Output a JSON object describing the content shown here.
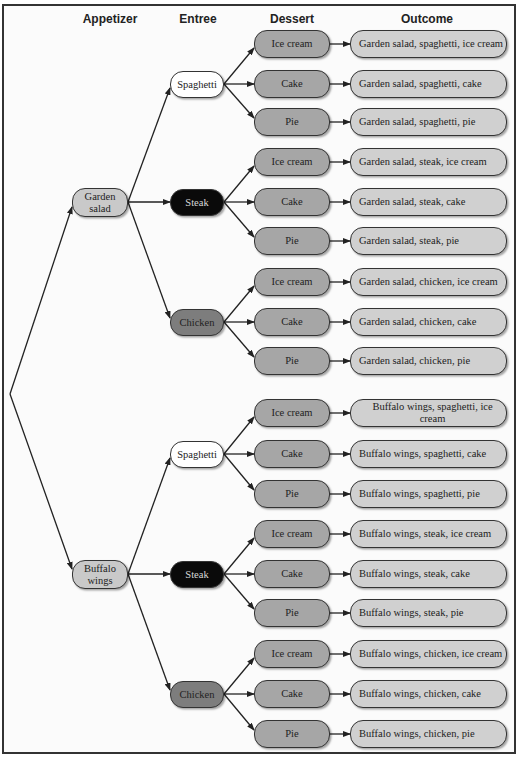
{
  "headers": {
    "appetizer": "Appetizer",
    "entree": "Entree",
    "dessert": "Dessert",
    "outcome": "Outcome"
  },
  "colors": {
    "appetizer": "#c9c9c9",
    "spaghetti": "#ffffff",
    "steak": "#0a0a0a",
    "chicken": "#7d7d7d",
    "dessert": "#a6a6a6",
    "outcome": "#d0d0d0",
    "line": "#222222"
  },
  "appetizers": [
    {
      "label": "Garden salad",
      "line1": "Garden",
      "line2": "salad"
    },
    {
      "label": "Buffalo wings",
      "line1": "Buffalo",
      "line2": "wings"
    }
  ],
  "entrees": [
    {
      "label": "Spaghetti"
    },
    {
      "label": "Steak"
    },
    {
      "label": "Chicken"
    },
    {
      "label": "Spaghetti"
    },
    {
      "label": "Steak"
    },
    {
      "label": "Chicken"
    }
  ],
  "desserts": [
    {
      "label": "Ice cream"
    },
    {
      "label": "Cake"
    },
    {
      "label": "Pie"
    },
    {
      "label": "Ice cream"
    },
    {
      "label": "Cake"
    },
    {
      "label": "Pie"
    },
    {
      "label": "Ice cream"
    },
    {
      "label": "Cake"
    },
    {
      "label": "Pie"
    },
    {
      "label": "Ice cream"
    },
    {
      "label": "Cake"
    },
    {
      "label": "Pie"
    },
    {
      "label": "Ice cream"
    },
    {
      "label": "Cake"
    },
    {
      "label": "Pie"
    },
    {
      "label": "Ice cream"
    },
    {
      "label": "Cake"
    },
    {
      "label": "Pie"
    }
  ],
  "outcomes": [
    {
      "label": "Garden salad, spaghetti, ice cream"
    },
    {
      "label": "Garden salad, spaghetti, cake"
    },
    {
      "label": "Garden salad, spaghetti, pie"
    },
    {
      "label": "Garden salad, steak, ice cream"
    },
    {
      "label": "Garden salad, steak, cake"
    },
    {
      "label": "Garden salad, steak, pie"
    },
    {
      "label": "Garden salad, chicken, ice cream"
    },
    {
      "label": "Garden salad, chicken, cake"
    },
    {
      "label": "Garden salad, chicken, pie"
    },
    {
      "label": "Buffalo wings, spaghetti, ice cream"
    },
    {
      "label": "Buffalo wings, spaghetti, cake"
    },
    {
      "label": "Buffalo wings, spaghetti, pie"
    },
    {
      "label": "Buffalo wings, steak, ice cream"
    },
    {
      "label": "Buffalo wings, steak, cake"
    },
    {
      "label": "Buffalo wings, steak, pie"
    },
    {
      "label": "Buffalo wings, chicken, ice cream"
    },
    {
      "label": "Buffalo wings, chicken, cake"
    },
    {
      "label": "Buffalo wings, chicken, pie"
    }
  ]
}
